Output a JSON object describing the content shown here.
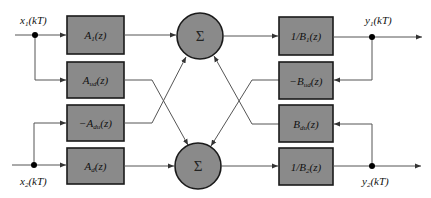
{
  "diagram": {
    "type": "two-channel filter structure",
    "inputs": [
      {
        "id": "x1",
        "label_main": "x",
        "label_sub": "1",
        "label_arg": "(kT)"
      },
      {
        "id": "x2",
        "label_main": "x",
        "label_sub": "2",
        "label_arg": "(kT)"
      }
    ],
    "outputs": [
      {
        "id": "y1",
        "label_main": "y",
        "label_sub": "1",
        "label_arg": "(kT)"
      },
      {
        "id": "y2",
        "label_main": "y",
        "label_sub": "2",
        "label_arg": "(kT)"
      }
    ],
    "left_blocks": [
      {
        "id": "A1",
        "prefix": "",
        "main": "A",
        "sub": "1",
        "arg": "(z)"
      },
      {
        "id": "Aud",
        "prefix": "",
        "main": "A",
        "sub": "ud",
        "arg": "(z)"
      },
      {
        "id": "Adu",
        "prefix": "−",
        "main": "A",
        "sub": "du",
        "arg": "(z)"
      },
      {
        "id": "Ad",
        "prefix": "",
        "main": "A",
        "sub": "d",
        "arg": "(z)"
      }
    ],
    "summers": [
      {
        "id": "sum_top",
        "symbol": "Σ"
      },
      {
        "id": "sum_bottom",
        "symbol": "Σ"
      }
    ],
    "right_blocks": [
      {
        "id": "invB1",
        "prefix": "1/",
        "main": "B",
        "sub": "1",
        "arg": "(z)"
      },
      {
        "id": "Bud",
        "prefix": "−",
        "main": "B",
        "sub": "ud",
        "arg": "(z)"
      },
      {
        "id": "Bdu",
        "prefix": "",
        "main": "B",
        "sub": "du",
        "arg": "(z)"
      },
      {
        "id": "invB2",
        "prefix": "1/",
        "main": "B",
        "sub": "2",
        "arg": "(z)"
      }
    ],
    "colors": {
      "block_fill": "#8a8a8a",
      "block_stroke": "#1a1a1a",
      "wire": "#555555",
      "background": "#ffffff"
    }
  }
}
